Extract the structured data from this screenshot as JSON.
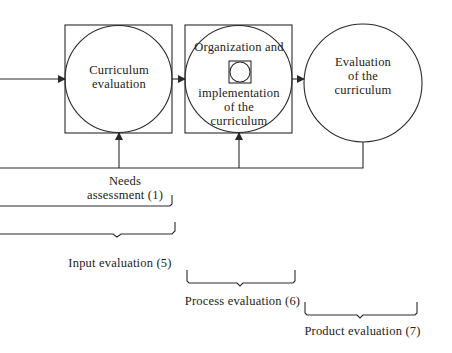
{
  "nodes": {
    "curriculum_evaluation": {
      "label_line1": "Curriculum",
      "label_line2": "evaluation"
    },
    "organization": {
      "label_line1": "Organization and",
      "label_line2": "implementation",
      "label_line3": "of the",
      "label_line4": "curriculum"
    },
    "evaluation_of_curriculum": {
      "label_line1": "Evaluation",
      "label_line2": "of the",
      "label_line3": "curriculum"
    }
  },
  "annotations": {
    "needs_line1": "Needs",
    "needs_line2": "assessment (1)",
    "input": "Input evaluation (5)",
    "process": "Process evaluation (6)",
    "product": "Product evaluation (7)"
  },
  "colors": {
    "stroke": "#2a2a2a",
    "text": "#222222",
    "background": "#ffffff"
  }
}
